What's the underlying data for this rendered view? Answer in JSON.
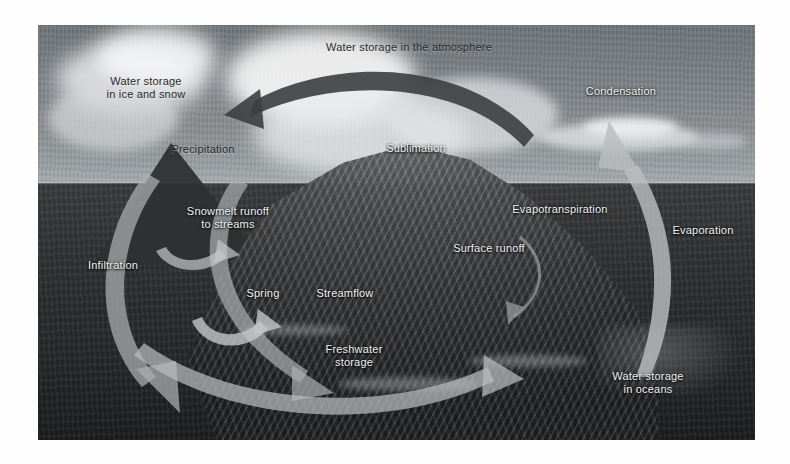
{
  "figure": {
    "type": "water-cycle-diagram",
    "medium": "grayscale photograph with overlaid arrows and labels",
    "frame": {
      "background_color": "#ffffff"
    },
    "palette": {
      "sky": "#8b8f92",
      "ocean": "#2b2d2f",
      "mountain": "#45484a",
      "arrow_dark": "#3c3f41",
      "arrow_light": "#b9bdbf",
      "label_light": "#f2f3f4",
      "label_dark": "#26292b"
    }
  },
  "labels": [
    {
      "id": "water-storage-atmosphere",
      "text": "Water storage in the atmosphere",
      "tone": "dark"
    },
    {
      "id": "water-storage-ice-snow",
      "text": "Water storage\nin ice and snow",
      "tone": "dark"
    },
    {
      "id": "condensation",
      "text": "Condensation",
      "tone": "light"
    },
    {
      "id": "precipitation",
      "text": "Precipitation",
      "tone": "dark"
    },
    {
      "id": "sublimation",
      "text": "Sublimation",
      "tone": "light"
    },
    {
      "id": "evapotranspiration",
      "text": "Evapotranspiration",
      "tone": "light"
    },
    {
      "id": "evaporation",
      "text": "Evaporation",
      "tone": "light"
    },
    {
      "id": "snowmelt-runoff",
      "text": "Snowmelt runoff\nto streams",
      "tone": "light"
    },
    {
      "id": "infiltration",
      "text": "Infiltration",
      "tone": "light"
    },
    {
      "id": "spring",
      "text": "Spring",
      "tone": "light"
    },
    {
      "id": "streamflow",
      "text": "Streamflow",
      "tone": "light"
    },
    {
      "id": "surface-runoff",
      "text": "Surface runoff",
      "tone": "light"
    },
    {
      "id": "freshwater-storage",
      "text": "Freshwater\nstorage",
      "tone": "light"
    },
    {
      "id": "water-storage-oceans",
      "text": "Water storage\nin oceans",
      "tone": "light"
    }
  ],
  "arrows": [
    {
      "id": "atmosphere-transport-arrow",
      "direction": "left",
      "color": "#3c3f41",
      "describes": "water storage in the atmosphere"
    },
    {
      "id": "evaporation-arrow",
      "direction": "up",
      "color": "#b9bdbf",
      "describes": "evaporation from ocean to cloud"
    },
    {
      "id": "infiltration-arrow",
      "direction": "down-right",
      "color": "#a8acae",
      "describes": "infiltration into ground"
    },
    {
      "id": "snowmelt-arrow",
      "direction": "down-right",
      "color": "#a8acae",
      "describes": "snowmelt runoff to streams"
    },
    {
      "id": "spring-arrow",
      "direction": "right",
      "color": "#b9bdbf",
      "describes": "groundwater emerging as spring"
    },
    {
      "id": "surface-runoff-arrow",
      "direction": "down-left",
      "color": "#9a9ea0",
      "describes": "surface runoff down slope"
    },
    {
      "id": "ocean-return-arrow",
      "direction": "right",
      "color": "#b9bdbf",
      "describes": "freshwater returning to the ocean"
    }
  ]
}
